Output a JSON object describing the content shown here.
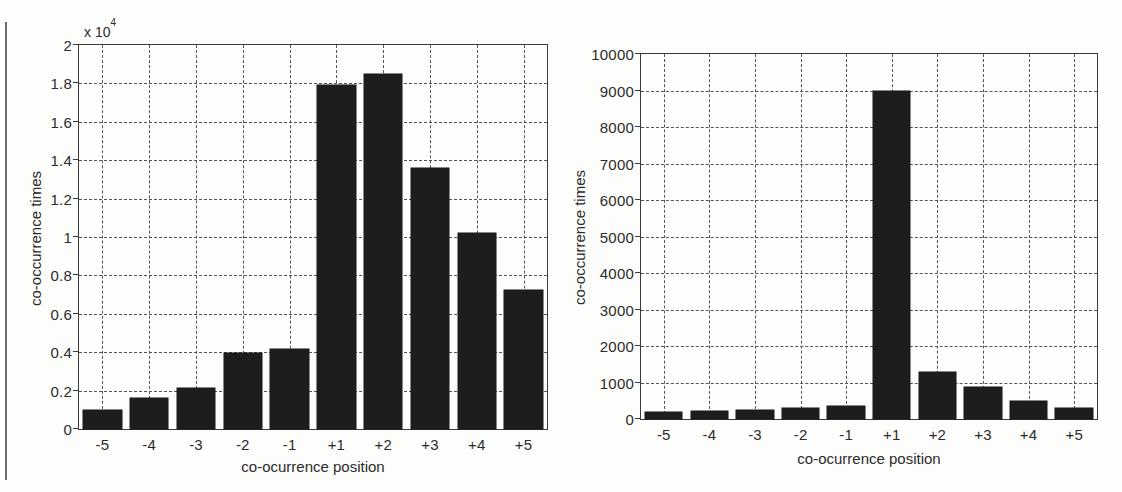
{
  "figures": [
    {
      "id": "left-chart",
      "chart_data": {
        "type": "bar",
        "title": "",
        "xlabel": "co-ocurrence position",
        "ylabel": "co-occurrence times",
        "exponent_label": "x 10",
        "exponent_power": "4",
        "categories": [
          "-5",
          "-4",
          "-3",
          "-2",
          "-1",
          "+1",
          "+2",
          "+3",
          "+4",
          "+5"
        ],
        "values": [
          1000,
          1600,
          2150,
          3950,
          4150,
          17900,
          18500,
          13600,
          10200,
          7250
        ],
        "ytick_labels": [
          "2",
          "1.8",
          "1.6",
          "1.4",
          "1.2",
          "1",
          "0.8",
          "0.6",
          "0.4",
          "0.2",
          "0"
        ],
        "ytick_values": [
          20000,
          18000,
          16000,
          14000,
          12000,
          10000,
          8000,
          6000,
          4000,
          2000,
          0
        ],
        "ylim": [
          0,
          20000
        ],
        "grid": true,
        "legend": "none",
        "bar_color": "#1d1d1d"
      }
    },
    {
      "id": "right-chart",
      "chart_data": {
        "type": "bar",
        "title": "",
        "xlabel": "co-ocurrence position",
        "ylabel": "co-occurrence times",
        "exponent_label": "",
        "exponent_power": "",
        "categories": [
          "-5",
          "-4",
          "-3",
          "-2",
          "-1",
          "+1",
          "+2",
          "+3",
          "+4",
          "+5"
        ],
        "values": [
          180,
          220,
          250,
          290,
          350,
          9000,
          1280,
          880,
          480,
          290
        ],
        "ytick_labels": [
          "10000",
          "9000",
          "8000",
          "7000",
          "6000",
          "5000",
          "4000",
          "3000",
          "2000",
          "1000",
          "0"
        ],
        "ytick_values": [
          10000,
          9000,
          8000,
          7000,
          6000,
          5000,
          4000,
          3000,
          2000,
          1000,
          0
        ],
        "ylim": [
          0,
          10000
        ],
        "grid": true,
        "legend": "none",
        "bar_color": "#1d1d1d"
      }
    }
  ]
}
